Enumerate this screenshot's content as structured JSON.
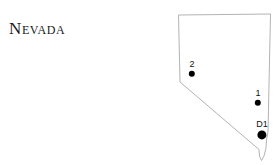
{
  "figure": {
    "width": 279,
    "height": 165,
    "background_color": "#ffffff"
  },
  "title": {
    "text": "Nevada",
    "color": "#1a1a1a"
  },
  "map": {
    "name": "nevada-state-outline",
    "outline_color": "#b3b3b3",
    "outline_width": 1,
    "fill_color": "#ffffff",
    "path": "M 178.5 15.0 L 270.5 14.0 L 268.0 131.5 L 266.5 140.0 L 266.0 148.0 L 264.0 156.0 L 261.5 160.5 L 259.5 156.0 L 259.0 149.5 L 180.0 82.0 L 178.5 15.0 Z"
  },
  "markers": [
    {
      "id": "marker-2",
      "label": "2",
      "x": 192,
      "y": 74,
      "radius": 3.2,
      "color": "#000000",
      "label_x": 192,
      "label_y": 69
    },
    {
      "id": "marker-1",
      "label": "1",
      "x": 258,
      "y": 103,
      "radius": 3.2,
      "color": "#000000",
      "label_x": 258,
      "label_y": 98
    },
    {
      "id": "marker-d1",
      "label": "D1",
      "x": 262,
      "y": 135,
      "radius": 4.6,
      "color": "#000000",
      "label_x": 262,
      "label_y": 129
    }
  ]
}
